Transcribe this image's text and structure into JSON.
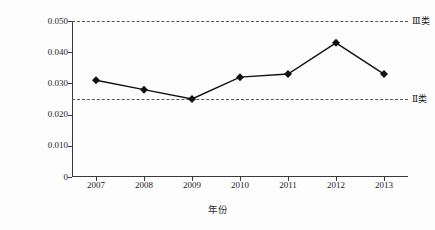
{
  "chart_data": {
    "type": "line",
    "title": "",
    "xlabel": "年份",
    "ylabel": "总磷浓度/（mg/L）",
    "categories": [
      "2007",
      "2008",
      "2009",
      "2010",
      "2011",
      "2012",
      "2013"
    ],
    "values": [
      0.031,
      0.028,
      0.025,
      0.032,
      0.033,
      0.043,
      0.033
    ],
    "series": [
      {
        "name": "总磷浓度",
        "values": [
          0.031,
          0.028,
          0.025,
          0.032,
          0.033,
          0.043,
          0.033
        ],
        "marker": "diamond",
        "color": "#111111"
      }
    ],
    "ylim": [
      0,
      0.05
    ],
    "yticks": [
      0,
      0.01,
      0.02,
      0.03,
      0.04,
      0.05
    ],
    "ytick_labels": [
      "0",
      "0.010",
      "0.020",
      "0.030",
      "0.040",
      "0.050"
    ],
    "grid": false,
    "legend_position": "none",
    "reference_lines": [
      {
        "label": "Ⅲ类",
        "value": 0.05,
        "style": "dashed",
        "color": "#555555"
      },
      {
        "label": "Ⅱ类",
        "value": 0.025,
        "style": "dashed",
        "color": "#555555"
      }
    ]
  },
  "colors": {
    "line": "#111111",
    "axis": "#3a3a3a",
    "reference": "#555555",
    "background": "#fdfdfd"
  }
}
